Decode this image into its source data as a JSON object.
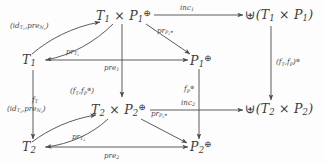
{
  "diagram": {
    "type": "commutative-diagram",
    "title": "",
    "stroke_color": "#4a4a4a",
    "text_color": "#3b3b3b",
    "background": "#fdfdfd",
    "nodes": [
      {
        "id": "prod1",
        "label": "T₁ × P₁^⊕",
        "x": 118,
        "y": 16,
        "tex": "T_1 \\times P_1^\\oplus"
      },
      {
        "id": "sum1",
        "label": "⊎(T₁ × P₁)",
        "x": 269,
        "y": 17,
        "tex": "\\uplus(T_1 \\times P_1)"
      },
      {
        "id": "t1",
        "label": "T₁",
        "x": 29,
        "y": 62,
        "tex": "T_1"
      },
      {
        "id": "p1",
        "label": "P₁^⊕",
        "x": 196,
        "y": 61,
        "tex": "P_1^\\oplus"
      },
      {
        "id": "prod2",
        "label": "T₂ × P₂^⊕",
        "x": 113,
        "y": 110,
        "tex": "T_2 \\times P_2^\\oplus"
      },
      {
        "id": "sum2",
        "label": "⊎(T₂ × P₂)",
        "x": 269,
        "y": 111,
        "tex": "\\uplus(T_2 \\times P_2)"
      },
      {
        "id": "t2",
        "label": "T₂",
        "x": 29,
        "y": 149,
        "tex": "T_2"
      },
      {
        "id": "p2",
        "label": "P₂^⊕",
        "x": 196,
        "y": 148,
        "tex": "P_2^\\oplus"
      }
    ],
    "edges": [
      {
        "id": "inc1",
        "from": "prod1",
        "to": "sum1",
        "label": "inc₁",
        "tex": "inc_1"
      },
      {
        "id": "inc2",
        "from": "prod2",
        "to": "sum2",
        "label": "inc₂",
        "tex": "inc_2"
      },
      {
        "id": "pairsum",
        "from": "sum1",
        "to": "sum2",
        "label": "(f_T, f_P)^⊕",
        "tex": "(f_T,f_P)^\\oplus"
      },
      {
        "id": "pair1",
        "from": "t1",
        "to": "prod1",
        "label": "(id_{T₁}, pre_{N₁})",
        "tex": "(id_{T_1},pre_{N_1})"
      },
      {
        "id": "pair2",
        "from": "t2",
        "to": "prod2",
        "label": "(id_{T₂}, pre_{N₂})",
        "tex": "(id_{T_2},pre_{N_2})"
      },
      {
        "id": "prt1",
        "from": "prod1",
        "to": "t1",
        "label": "pr_{T₁}",
        "tex": "pr_{T_1}"
      },
      {
        "id": "prt2",
        "from": "prod2",
        "to": "t2",
        "label": "pr_{T₂}",
        "tex": "pr_{T_2}"
      },
      {
        "id": "prp1",
        "from": "prod1",
        "to": "p1",
        "label": "pr_{P₁^⊕}",
        "tex": "pr_{P_1^\\oplus}"
      },
      {
        "id": "prp2",
        "from": "prod2",
        "to": "p2",
        "label": "pr_{P₂^⊕}",
        "tex": "pr_{P_2^\\oplus}"
      },
      {
        "id": "pre1",
        "from": "t1",
        "to": "p1",
        "label": "pre₁",
        "tex": "pre_1"
      },
      {
        "id": "pre2",
        "from": "t2",
        "to": "p2",
        "label": "pre₂",
        "tex": "pre_2"
      },
      {
        "id": "ft",
        "from": "t1",
        "to": "t2",
        "label": "f_T",
        "tex": "f_T"
      },
      {
        "id": "pairprod",
        "from": "prod1",
        "to": "prod2",
        "label": "(f_T, f_P^⊕)",
        "tex": "(f_T,f_P^\\oplus)"
      },
      {
        "id": "fp",
        "from": "p1",
        "to": "p2",
        "label": "f_P^⊕",
        "tex": "f_P^\\oplus"
      }
    ]
  }
}
